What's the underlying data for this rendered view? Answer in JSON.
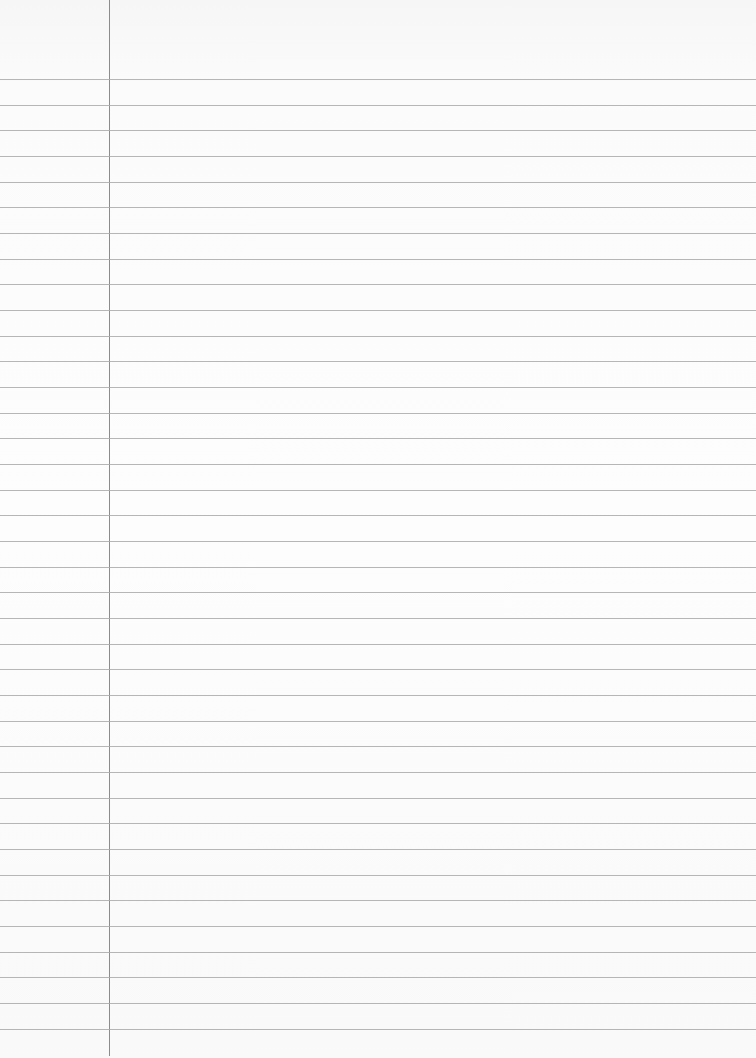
{
  "paper": {
    "type": "ruled-notebook-page",
    "background_color": "#fafafa",
    "rule_color": "#a9a9a9",
    "margin_color": "#8c8c8c",
    "margin_x": 109,
    "first_rule_y": 79,
    "rule_spacing": 25.67,
    "rule_count": 38
  }
}
